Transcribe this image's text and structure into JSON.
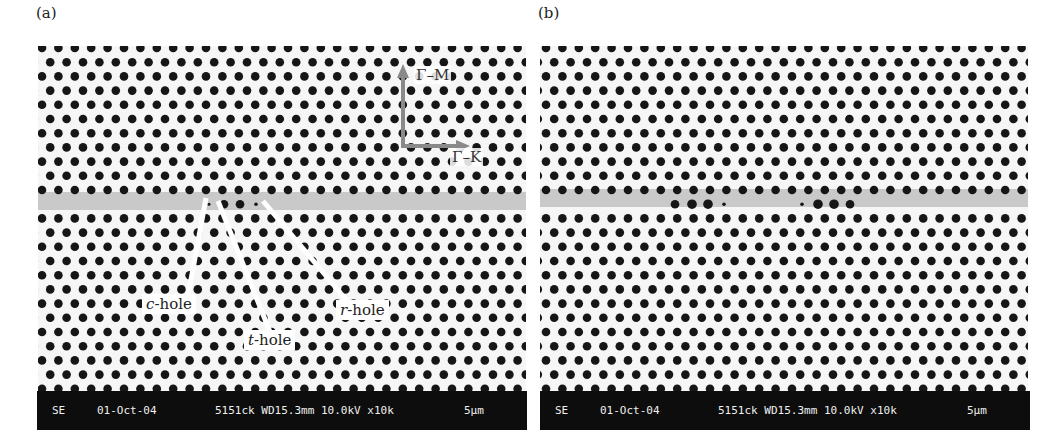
{
  "figure": {
    "panels": [
      {
        "id": "a",
        "label": "(a)",
        "annotations": {
          "gamma_m": "Γ–M",
          "gamma_k": "Γ–K",
          "c_hole_prefix": "c",
          "t_hole_prefix": "t",
          "r_hole_prefix": "r",
          "hole_suffix": "-hole"
        },
        "infobar": {
          "mode": "SE",
          "date": "01-Oct-04",
          "params": "5151ck WD15.3mm 10.0kV x10k",
          "scale": "5µm"
        }
      },
      {
        "id": "b",
        "label": "(b)",
        "infobar": {
          "mode": "SE",
          "date": "01-Oct-04",
          "params": "5151ck WD15.3mm 10.0kV x10k",
          "scale": "5µm"
        }
      }
    ],
    "colors": {
      "hole": "#161616",
      "waveguide": "#c9c9c9",
      "arrow": "#8a8a8a",
      "infobar_bg": "#0d0d0d",
      "infobar_text": "#f0f0f0"
    }
  }
}
